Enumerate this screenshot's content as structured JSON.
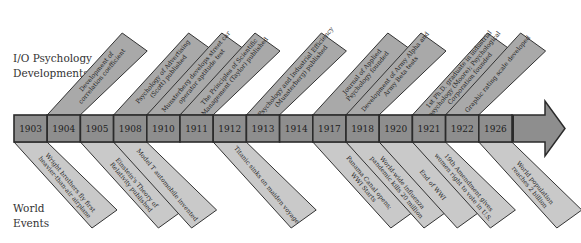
{
  "labels": {
    "top": [
      "I/O Psychology",
      "Developments"
    ],
    "bottom": [
      "World",
      "Events"
    ]
  },
  "colors": {
    "bar_fill": "#8e8e8e",
    "bar_stroke": "#2b2b2b",
    "top_banner_fill": "#a9a9a9",
    "bottom_banner_fill": "#c9c9c9",
    "banner_stroke": "#333333",
    "text": "#222222"
  },
  "timeline": {
    "years": [
      "1903",
      "1904",
      "1905",
      "1908",
      "1910",
      "1911",
      "1912",
      "1913",
      "1914",
      "1917",
      "1918",
      "1920",
      "1921",
      "1922",
      "1926"
    ]
  },
  "io_developments": [
    {
      "year_index": 1,
      "lines": [
        "Development of",
        "correlation coefficient"
      ]
    },
    {
      "year_index": 3,
      "lines": [
        "Psychology of Advertising",
        "(Scott) published"
      ]
    },
    {
      "year_index": 4,
      "lines": [
        "Munsterberg develops street car",
        "operator aptitude test"
      ]
    },
    {
      "year_index": 5,
      "lines": [
        "The Principles of Scientific",
        "Management (Taylor) published"
      ]
    },
    {
      "year_index": 7,
      "lines": [
        "Psychology and Industrial Efficiency",
        "(Munsterberg) published"
      ]
    },
    {
      "year_index": 9,
      "lines": [
        "Journal of Applied",
        "Psychology founded"
      ]
    },
    {
      "year_index": 10,
      "lines": [
        "Development of Army Alpha and",
        "Army Beta tests"
      ]
    },
    {
      "year_index": 12,
      "lines": [
        "1st Ph.D. graduate in industrial",
        "psychology (Moore); Psychological",
        "Corporation founded"
      ]
    },
    {
      "year_index": 13,
      "lines": [
        "Graphic rating scale developed"
      ]
    }
  ],
  "world_events": [
    {
      "year_index": 0,
      "lines": [
        "Wright brothers fly first",
        "heavier-than-air airplane"
      ]
    },
    {
      "year_index": 2,
      "lines": [
        "Einstein's Theory of",
        "Relativity published"
      ]
    },
    {
      "year_index": 3,
      "lines": [
        "Model T automobile invented"
      ]
    },
    {
      "year_index": 6,
      "lines": [
        "Titanic sinks on maiden voyage"
      ]
    },
    {
      "year_index": 9,
      "lines": [
        "Panama Canal opens;",
        "WWI Starts"
      ]
    },
    {
      "year_index": 10,
      "lines": [
        "World-wide influenza",
        "pandemic kills 20 million"
      ]
    },
    {
      "year_index": 11,
      "lines": [
        "End of WWI"
      ]
    },
    {
      "year_index": 12,
      "lines": [
        "19th Amendment gives",
        "women right to vote in U.S."
      ]
    },
    {
      "year_index": 14,
      "lines": [
        "World population",
        "reaches 2 billion"
      ]
    }
  ]
}
